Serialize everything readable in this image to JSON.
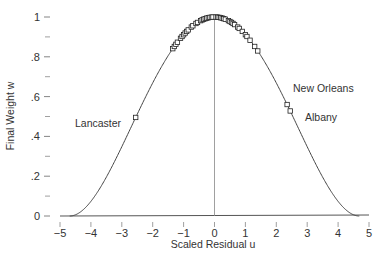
{
  "chart_data": {
    "type": "scatter",
    "title": "",
    "xlabel": "Scaled Residual u",
    "ylabel": "Final Weight w",
    "xlim": [
      -5,
      5
    ],
    "ylim": [
      0,
      1
    ],
    "grid": false,
    "legend": null,
    "x_ticks": [
      -5,
      -4,
      -3,
      -2,
      -1,
      0,
      1,
      2,
      3,
      4,
      5
    ],
    "x_tick_labels": [
      "−5",
      "−4",
      "−3",
      "−2",
      "−1",
      "0",
      "1",
      "2",
      "3",
      "4",
      "5"
    ],
    "y_ticks": [
      0,
      0.2,
      0.4,
      0.6,
      0.8,
      1
    ],
    "y_tick_labels": [
      "0",
      ".2",
      ".4",
      ".6",
      ".8",
      "1"
    ],
    "y_minor_ticks": [
      0.1,
      0.3,
      0.5,
      0.7,
      0.9
    ],
    "curve": {
      "name": "biweight weight function",
      "formula": "w = (1 - (u/c)^2)^2 for |u| < c, else 0",
      "c": 4.685
    },
    "vertical_reference_line": 0,
    "points_u": [
      -2.55,
      -1.35,
      -1.3,
      -1.25,
      -1.2,
      -1.1,
      -1.05,
      -1.0,
      -0.95,
      -0.9,
      -0.85,
      -0.75,
      -0.7,
      -0.6,
      -0.55,
      -0.45,
      -0.4,
      -0.35,
      -0.3,
      -0.25,
      -0.2,
      -0.15,
      -0.1,
      -0.05,
      0.05,
      0.1,
      0.15,
      0.2,
      0.25,
      0.3,
      0.35,
      0.45,
      0.5,
      0.55,
      0.6,
      0.65,
      0.75,
      0.8,
      0.9,
      1.0,
      1.05,
      1.15,
      1.3,
      1.4,
      2.35,
      2.45
    ],
    "annotations": [
      {
        "text": "Lancaster",
        "u": -2.55,
        "w": 0.45
      },
      {
        "text": "New Orleans",
        "u": 2.35,
        "w": 0.56
      },
      {
        "text": "Albany",
        "u": 2.45,
        "w": 0.53
      }
    ]
  }
}
